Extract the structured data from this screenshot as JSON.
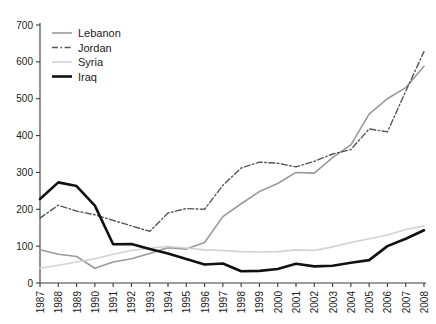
{
  "chart_data": {
    "type": "line",
    "title": "",
    "subtitle": "",
    "xlabel": "",
    "ylabel": "",
    "x": [
      1987,
      1988,
      1989,
      1990,
      1991,
      1992,
      1993,
      1994,
      1995,
      1996,
      1997,
      1998,
      1999,
      2000,
      2001,
      2002,
      2003,
      2004,
      2005,
      2006,
      2007,
      2008
    ],
    "xtick_labels": [
      "1987",
      "1988",
      "1989",
      "1990",
      "1991",
      "1992",
      "1993",
      "1994",
      "1995",
      "1996",
      "1997",
      "1998",
      "1999",
      "2000",
      "2001",
      "2002",
      "2003",
      "2004",
      "2005",
      "2006",
      "2007",
      "2008"
    ],
    "ytick_labels": [
      "0",
      "100",
      "200",
      "300",
      "400",
      "500",
      "600",
      "700"
    ],
    "yticks": [
      0,
      100,
      200,
      300,
      400,
      500,
      600,
      700
    ],
    "ylim": [
      0,
      700
    ],
    "xlim": [
      1987,
      2008
    ],
    "grid": false,
    "legend_position": "top-left",
    "series": [
      {
        "name": "Lebanon",
        "color": "#9a9a9a",
        "style": "solid",
        "width": 1.6,
        "values": [
          90,
          78,
          72,
          40,
          57,
          66,
          80,
          96,
          92,
          110,
          180,
          215,
          248,
          270,
          300,
          298,
          340,
          375,
          458,
          500,
          530,
          588
        ]
      },
      {
        "name": "Jordan",
        "color": "#555555",
        "style": "dashdot",
        "width": 1.4,
        "values": [
          176,
          211,
          195,
          185,
          170,
          155,
          140,
          190,
          202,
          200,
          265,
          312,
          328,
          325,
          315,
          330,
          350,
          362,
          418,
          410,
          520,
          628
        ]
      },
      {
        "name": "Syria",
        "color": "#d2d2d2",
        "style": "solid",
        "width": 1.6,
        "values": [
          40,
          48,
          57,
          66,
          78,
          88,
          95,
          99,
          95,
          90,
          88,
          85,
          84,
          85,
          90,
          88,
          98,
          110,
          120,
          130,
          145,
          155
        ]
      },
      {
        "name": "Iraq",
        "color": "#111111",
        "style": "solid",
        "width": 2.6,
        "values": [
          228,
          273,
          263,
          210,
          105,
          106,
          92,
          80,
          65,
          50,
          53,
          32,
          33,
          38,
          52,
          45,
          47,
          55,
          62,
          100,
          120,
          143
        ]
      }
    ]
  },
  "legend": {
    "items": [
      {
        "label": "Lebanon"
      },
      {
        "label": "Jordan"
      },
      {
        "label": "Syria"
      },
      {
        "label": "Iraq"
      }
    ]
  },
  "axis": {
    "y_axis_name": "value-axis",
    "x_axis_name": "year-axis"
  }
}
